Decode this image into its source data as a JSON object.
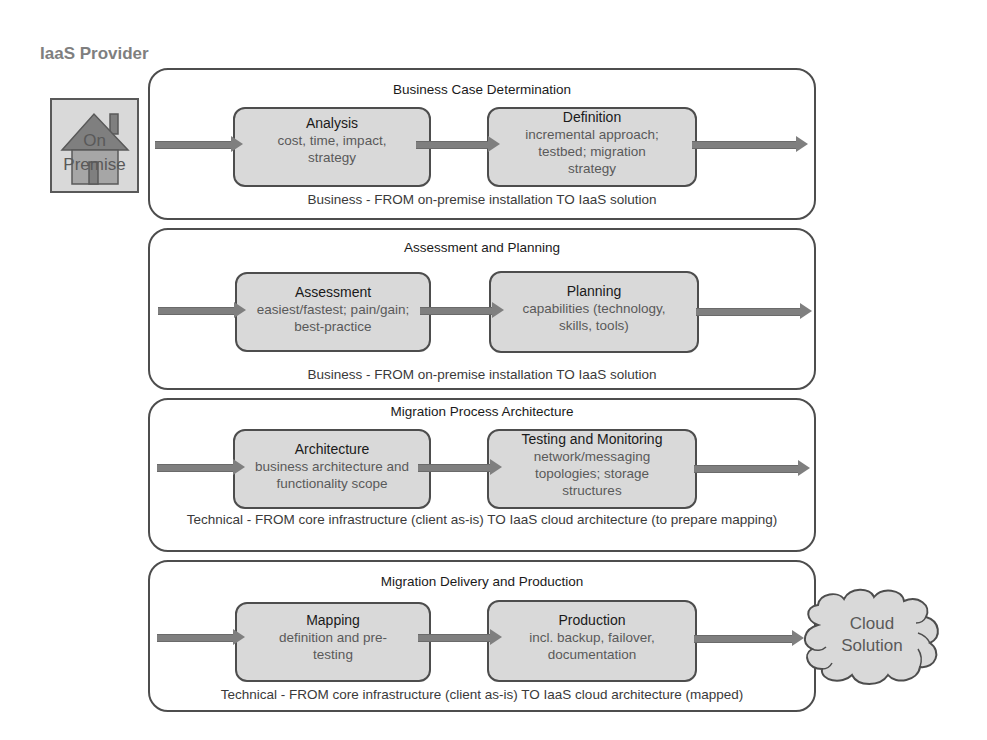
{
  "header": {
    "title": "IaaS Provider"
  },
  "source": {
    "label_line1": "On",
    "label_line2": "Premise",
    "icon": "house-icon"
  },
  "target": {
    "label_line1": "Cloud",
    "label_line2": "Solution",
    "icon": "cloud-icon"
  },
  "colors": {
    "panel_border": "#4d4d4d",
    "step_fill": "#d9d9d9",
    "arrow_fill": "#7f7f7f",
    "title_gray": "#7f7f7f"
  },
  "phases": [
    {
      "title": "Business Case Determination",
      "footer": "Business - FROM on-premise installation TO IaaS solution",
      "steps": [
        {
          "title": "Analysis",
          "desc": "cost, time, impact, strategy"
        },
        {
          "title": "Definition",
          "desc": "incremental approach; testbed; migration strategy"
        }
      ]
    },
    {
      "title": "Assessment and Planning",
      "footer": "Business - FROM on-premise installation TO IaaS solution",
      "steps": [
        {
          "title": "Assessment",
          "desc": "easiest/fastest; pain/gain; best-practice"
        },
        {
          "title": "Planning",
          "desc": "capabilities (technology, skills, tools)"
        }
      ]
    },
    {
      "title": "Migration Process Architecture",
      "footer": "Technical - FROM core infrastructure (client as-is) TO IaaS cloud architecture (to prepare mapping)",
      "steps": [
        {
          "title": "Architecture",
          "desc": "business architecture and functionality scope"
        },
        {
          "title": "Testing and Monitoring",
          "desc": "network/messaging topologies; storage structures"
        }
      ]
    },
    {
      "title": "Migration Delivery and Production",
      "footer": "Technical - FROM core infrastructure (client as-is) TO IaaS cloud architecture (mapped)",
      "steps": [
        {
          "title": "Mapping",
          "desc": "definition and pre-testing"
        },
        {
          "title": "Production",
          "desc": "incl. backup, failover, documentation"
        }
      ]
    }
  ]
}
